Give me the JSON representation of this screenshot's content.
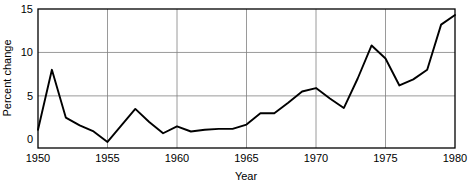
{
  "chart_data": {
    "type": "line",
    "title": "",
    "xlabel": "Year",
    "ylabel": "Percent change",
    "xlim": [
      1950,
      1980
    ],
    "ylim": [
      -1.0,
      15
    ],
    "grid": true,
    "legend": false,
    "xticks": [
      1950,
      1955,
      1960,
      1965,
      1970,
      1975,
      1980
    ],
    "xtick_labels": [
      "1950",
      "1955",
      "1960",
      "1965",
      "1970",
      "1975",
      "1980"
    ],
    "yticks": [
      0,
      5,
      10,
      15
    ],
    "ytick_labels": [
      "0",
      "5",
      "10",
      "15"
    ],
    "x": [
      1950,
      1951,
      1952,
      1953,
      1954,
      1955,
      1956,
      1957,
      1958,
      1959,
      1960,
      1961,
      1962,
      1963,
      1964,
      1965,
      1966,
      1967,
      1968,
      1969,
      1970,
      1971,
      1972,
      1973,
      1974,
      1975,
      1976,
      1977,
      1978,
      1979,
      1980
    ],
    "values": [
      1.1,
      8.0,
      2.5,
      1.6,
      0.9,
      -0.3,
      1.6,
      3.5,
      2.0,
      0.7,
      1.5,
      0.9,
      1.1,
      1.2,
      1.2,
      1.7,
      3.0,
      3.0,
      4.2,
      5.5,
      5.9,
      4.7,
      3.6,
      7.0,
      10.8,
      9.3,
      6.2,
      6.9,
      8.0,
      13.2,
      14.3
    ],
    "series_name": "Percent change",
    "line_color": "#000000",
    "grid_color": "#808080",
    "axis_color": "#000000",
    "background_color": "#ffffff"
  },
  "axes": {
    "x_title": "Year",
    "y_title": "Percent change"
  }
}
